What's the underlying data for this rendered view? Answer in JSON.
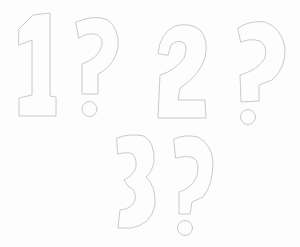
{
  "image": {
    "description": "Pencil sketch of outlined hand-drawn characters on white paper",
    "background_color": "#fdfdfd",
    "stroke_color": "#c4c4c4",
    "lines": [
      {
        "text": "1?",
        "glyphs": [
          "1",
          "?"
        ]
      },
      {
        "text": "2?",
        "glyphs": [
          "2",
          "?"
        ]
      },
      {
        "text": "3?",
        "glyphs": [
          "3",
          "?"
        ]
      }
    ]
  }
}
